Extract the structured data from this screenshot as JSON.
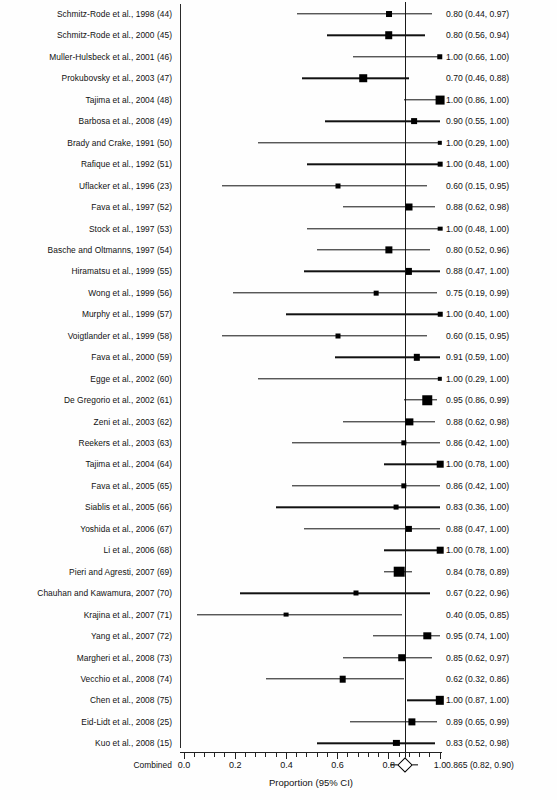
{
  "chart_data": {
    "type": "forest",
    "title": "",
    "xlabel": "Proportion (95% CI)",
    "ylabel": "",
    "xlim": [
      0.0,
      1.0
    ],
    "xticks": [
      0.0,
      0.2,
      0.4,
      0.6,
      0.8,
      1.0
    ],
    "xticklabels": [
      "0.0",
      "0.2",
      "0.4",
      "0.6",
      "0.8",
      "1.0"
    ],
    "grid": false,
    "legend": "none",
    "reference_line": 0.865,
    "rows": [
      {
        "label": "Schmitz-Rode et al., 1998 (44)",
        "value": "0.80 (0.44, 0.97)",
        "est": 0.8,
        "lo": 0.44,
        "hi": 0.97,
        "weight": 0.42
      },
      {
        "label": "Schmitz-Rode et al., 2000 (45)",
        "value": "0.80 (0.56, 0.94)",
        "est": 0.8,
        "lo": 0.56,
        "hi": 0.94,
        "weight": 0.62
      },
      {
        "label": "Muller-Hulsbeck et al., 2001 (46)",
        "value": "1.00 (0.66, 1.00)",
        "est": 1.0,
        "lo": 0.66,
        "hi": 1.0,
        "weight": 0.36
      },
      {
        "label": "Prokubovsky et al., 2003 (47)",
        "value": "0.70 (0.46, 0.88)",
        "est": 0.7,
        "lo": 0.46,
        "hi": 0.88,
        "weight": 0.62
      },
      {
        "label": "Tajima et al., 2004 (48)",
        "value": "1.00 (0.86, 1.00)",
        "est": 1.0,
        "lo": 0.86,
        "hi": 1.0,
        "weight": 0.78
      },
      {
        "label": "Barbosa et al., 2008 (49)",
        "value": "0.90 (0.55, 1.00)",
        "est": 0.9,
        "lo": 0.55,
        "hi": 1.0,
        "weight": 0.4
      },
      {
        "label": "Brady and Crake, 1991 (50)",
        "value": "1.00 (0.29, 1.00)",
        "est": 1.0,
        "lo": 0.29,
        "hi": 1.0,
        "weight": 0.22
      },
      {
        "label": "Rafique et al., 1992 (51)",
        "value": "1.00 (0.48, 1.00)",
        "est": 1.0,
        "lo": 0.48,
        "hi": 1.0,
        "weight": 0.26
      },
      {
        "label": "Uflacker et al., 1996 (23)",
        "value": "0.60 (0.15, 0.95)",
        "est": 0.6,
        "lo": 0.15,
        "hi": 0.95,
        "weight": 0.3
      },
      {
        "label": "Fava et al., 1997 (52)",
        "value": "0.88 (0.62, 0.98)",
        "est": 0.88,
        "lo": 0.62,
        "hi": 0.98,
        "weight": 0.55
      },
      {
        "label": "Stock et al., 1997 (53)",
        "value": "1.00 (0.48, 1.00)",
        "est": 1.0,
        "lo": 0.48,
        "hi": 1.0,
        "weight": 0.26
      },
      {
        "label": "Basche and Oltmanns, 1997 (54)",
        "value": "0.80 (0.52, 0.96)",
        "est": 0.8,
        "lo": 0.52,
        "hi": 0.96,
        "weight": 0.58
      },
      {
        "label": "Hiramatsu et al., 1999 (55)",
        "value": "0.88 (0.47, 1.00)",
        "est": 0.88,
        "lo": 0.47,
        "hi": 1.0,
        "weight": 0.45
      },
      {
        "label": "Wong et al., 1999 (56)",
        "value": "0.75 (0.19, 0.99)",
        "est": 0.75,
        "lo": 0.19,
        "hi": 0.99,
        "weight": 0.26
      },
      {
        "label": "Murphy et al., 1999 (57)",
        "value": "1.00 (0.40, 1.00)",
        "est": 1.0,
        "lo": 0.4,
        "hi": 1.0,
        "weight": 0.24
      },
      {
        "label": "Voigtlander et al., 1999 (58)",
        "value": "0.60 (0.15, 0.95)",
        "est": 0.6,
        "lo": 0.15,
        "hi": 0.95,
        "weight": 0.3
      },
      {
        "label": "Fava et al., 2000 (59)",
        "value": "0.91 (0.59, 1.00)",
        "est": 0.91,
        "lo": 0.59,
        "hi": 1.0,
        "weight": 0.47
      },
      {
        "label": "Egge et al., 2002 (60)",
        "value": "1.00 (0.29, 1.00)",
        "est": 1.0,
        "lo": 0.29,
        "hi": 1.0,
        "weight": 0.22
      },
      {
        "label": "De Gregorio et al., 2002 (61)",
        "value": "0.95 (0.86, 0.99)",
        "est": 0.95,
        "lo": 0.86,
        "hi": 0.99,
        "weight": 0.86
      },
      {
        "label": "Zeni et al., 2003 (62)",
        "value": "0.88 (0.62, 0.98)",
        "est": 0.88,
        "lo": 0.62,
        "hi": 0.98,
        "weight": 0.58
      },
      {
        "label": "Reekers et al., 2003 (63)",
        "value": "0.86 (0.42, 1.00)",
        "est": 0.86,
        "lo": 0.42,
        "hi": 1.0,
        "weight": 0.34
      },
      {
        "label": "Tajima et al., 2004 (64)",
        "value": "1.00 (0.78, 1.00)",
        "est": 1.0,
        "lo": 0.78,
        "hi": 1.0,
        "weight": 0.5
      },
      {
        "label": "Fava et al., 2005 (65)",
        "value": "0.86 (0.42, 1.00)",
        "est": 0.86,
        "lo": 0.42,
        "hi": 1.0,
        "weight": 0.34
      },
      {
        "label": "Siablis et al., 2005 (66)",
        "value": "0.83 (0.36, 1.00)",
        "est": 0.83,
        "lo": 0.36,
        "hi": 1.0,
        "weight": 0.28
      },
      {
        "label": "Yoshida et al., 2006 (67)",
        "value": "0.88 (0.47, 1.00)",
        "est": 0.88,
        "lo": 0.47,
        "hi": 1.0,
        "weight": 0.45
      },
      {
        "label": "Li et al., 2006 (68)",
        "value": "1.00 (0.78, 1.00)",
        "est": 1.0,
        "lo": 0.78,
        "hi": 1.0,
        "weight": 0.5
      },
      {
        "label": "Pieri and Agresti, 2007 (69)",
        "value": "0.84 (0.78, 0.89)",
        "est": 0.84,
        "lo": 0.78,
        "hi": 0.89,
        "weight": 1.0
      },
      {
        "label": "Chauhan and Kawamura, 2007 (70)",
        "value": "0.67 (0.22, 0.96)",
        "est": 0.67,
        "lo": 0.22,
        "hi": 0.96,
        "weight": 0.3
      },
      {
        "label": "Krajina et al., 2007 (71)",
        "value": "0.40 (0.05, 0.85)",
        "est": 0.4,
        "lo": 0.05,
        "hi": 0.85,
        "weight": 0.28
      },
      {
        "label": "Yang et al., 2007 (72)",
        "value": "0.95 (0.74, 1.00)",
        "est": 0.95,
        "lo": 0.74,
        "hi": 1.0,
        "weight": 0.6
      },
      {
        "label": "Margheri et al., 2008 (73)",
        "value": "0.85 (0.62, 0.97)",
        "est": 0.85,
        "lo": 0.62,
        "hi": 0.97,
        "weight": 0.62
      },
      {
        "label": "Vecchio et al., 2008 (74)",
        "value": "0.62 (0.32, 0.86)",
        "est": 0.62,
        "lo": 0.32,
        "hi": 0.86,
        "weight": 0.5
      },
      {
        "label": "Chen et al., 2008 (75)",
        "value": "1.00 (0.87, 1.00)",
        "est": 1.0,
        "lo": 0.87,
        "hi": 1.0,
        "weight": 0.72
      },
      {
        "label": "Eid-Lidt et al., 2008 (25)",
        "value": "0.89 (0.65, 0.99)",
        "est": 0.89,
        "lo": 0.65,
        "hi": 0.99,
        "weight": 0.58
      },
      {
        "label": "Kuo et al., 2008 (15)",
        "value": "0.83 (0.52, 0.98)",
        "est": 0.83,
        "lo": 0.52,
        "hi": 0.98,
        "weight": 0.45
      }
    ],
    "summary": {
      "label": "Combined",
      "value": "0.865 (0.82, 0.90)",
      "est": 0.865,
      "lo": 0.82,
      "hi": 0.9
    }
  },
  "colors": {
    "marker": "#000000",
    "line": "#111111",
    "axis": "#222222",
    "background": "#ffffff"
  }
}
